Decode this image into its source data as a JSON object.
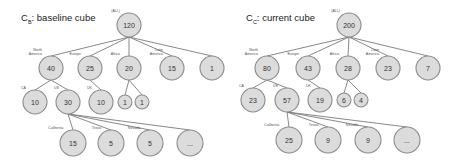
{
  "diagrams": [
    {
      "id": "baseline",
      "title_main": "C",
      "title_sub": "B",
      "title_rest": ": baseline cube",
      "title_pos": [
        21,
        16
      ],
      "nodes": [
        {
          "id": "root",
          "label": "(ALL)",
          "value": "120",
          "x": 129,
          "y": 25,
          "r": 12
        },
        {
          "id": "na",
          "label": "North America",
          "value": "40",
          "x": 51,
          "y": 68,
          "r": 12,
          "parent": "root"
        },
        {
          "id": "eu",
          "label": "Europe",
          "value": "25",
          "x": 90,
          "y": 68,
          "r": 12,
          "parent": "root"
        },
        {
          "id": "af",
          "label": "Africa",
          "value": "20",
          "x": 129,
          "y": 68,
          "r": 12,
          "parent": "root"
        },
        {
          "id": "la",
          "label": "Latin America",
          "value": "15",
          "x": 172,
          "y": 68,
          "r": 12,
          "parent": "root"
        },
        {
          "id": "ot",
          "label": "",
          "value": "1",
          "x": 212,
          "y": 68,
          "r": 12,
          "parent": "root"
        },
        {
          "id": "ca",
          "label": "CA",
          "value": "10",
          "x": 35,
          "y": 102,
          "r": 12,
          "parent": "na"
        },
        {
          "id": "us",
          "label": "US",
          "value": "30",
          "x": 68,
          "y": 102,
          "r": 12,
          "parent": "na"
        },
        {
          "id": "uk",
          "label": "UK",
          "value": "10",
          "x": 101,
          "y": 102,
          "r": 12,
          "parent": "eu"
        },
        {
          "id": "af1",
          "label": "",
          "value": "1",
          "x": 125,
          "y": 102,
          "r": 7,
          "parent": "af"
        },
        {
          "id": "af2",
          "label": "",
          "value": "1",
          "x": 142,
          "y": 102,
          "r": 7,
          "parent": "af"
        },
        {
          "id": "cal",
          "label": "California",
          "value": "15",
          "x": 73,
          "y": 143,
          "r": 13,
          "parent": "us"
        },
        {
          "id": "tx",
          "label": "Texas",
          "value": "5",
          "x": 111,
          "y": 143,
          "r": 13,
          "parent": "us"
        },
        {
          "id": "nv",
          "label": "Nevada",
          "value": "5",
          "x": 150,
          "y": 143,
          "r": 13,
          "parent": "us"
        },
        {
          "id": "more",
          "label": "",
          "value": "...",
          "x": 190,
          "y": 143,
          "r": 13,
          "parent": "us"
        }
      ]
    },
    {
      "id": "current",
      "title_main": "C",
      "title_sub": "C",
      "title_rest": ": current cube",
      "title_pos": [
        246,
        16
      ],
      "nodes": [
        {
          "id": "root",
          "label": "(ALL)",
          "value": "200",
          "x": 349,
          "y": 25,
          "r": 12
        },
        {
          "id": "na",
          "label": "North America",
          "value": "80",
          "x": 267,
          "y": 68,
          "r": 12,
          "parent": "root"
        },
        {
          "id": "eu",
          "label": "Europe",
          "value": "43",
          "x": 308,
          "y": 68,
          "r": 12,
          "parent": "root"
        },
        {
          "id": "af",
          "label": "Africa",
          "value": "28",
          "x": 348,
          "y": 68,
          "r": 12,
          "parent": "root"
        },
        {
          "id": "la",
          "label": "Latin America",
          "value": "23",
          "x": 388,
          "y": 68,
          "r": 12,
          "parent": "root"
        },
        {
          "id": "ot",
          "label": "",
          "value": "7",
          "x": 428,
          "y": 68,
          "r": 12,
          "parent": "root"
        },
        {
          "id": "ca",
          "label": "CA",
          "value": "23",
          "x": 253,
          "y": 100,
          "r": 12,
          "parent": "na"
        },
        {
          "id": "us",
          "label": "US",
          "value": "57",
          "x": 287,
          "y": 100,
          "r": 12,
          "parent": "na"
        },
        {
          "id": "uk",
          "label": "UK",
          "value": "19",
          "x": 320,
          "y": 100,
          "r": 12,
          "parent": "eu"
        },
        {
          "id": "af1",
          "label": "",
          "value": "6",
          "x": 344,
          "y": 100,
          "r": 7,
          "parent": "af"
        },
        {
          "id": "af2",
          "label": "",
          "value": "4",
          "x": 361,
          "y": 100,
          "r": 7,
          "parent": "af"
        },
        {
          "id": "cal",
          "label": "California",
          "value": "25",
          "x": 289,
          "y": 140,
          "r": 13,
          "parent": "us"
        },
        {
          "id": "tx",
          "label": "Texas",
          "value": "9",
          "x": 328,
          "y": 140,
          "r": 13,
          "parent": "us"
        },
        {
          "id": "nv",
          "label": "Nevada",
          "value": "9",
          "x": 368,
          "y": 140,
          "r": 13,
          "parent": "us"
        },
        {
          "id": "more",
          "label": "",
          "value": "...",
          "x": 407,
          "y": 140,
          "r": 13,
          "parent": "us"
        }
      ]
    }
  ]
}
